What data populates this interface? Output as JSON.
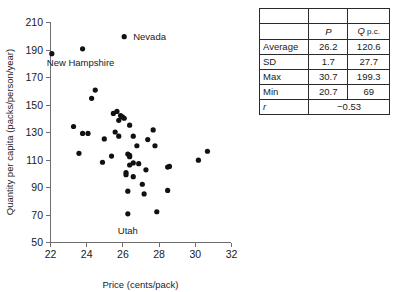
{
  "chart_data": {
    "type": "scatter",
    "title": "",
    "xlabel": "Price (cents/pack)",
    "ylabel": "Quantity per capita (packs/person/year)",
    "xlim": [
      22,
      32
    ],
    "ylim": [
      50,
      210
    ],
    "xticks": [
      22,
      24,
      26,
      28,
      30,
      32
    ],
    "yticks": [
      50,
      70,
      90,
      110,
      130,
      150,
      170,
      190,
      210
    ],
    "grid": false,
    "legend": "none",
    "annotations": [
      {
        "text": "Nevada",
        "x": 26.1,
        "y": 199.3
      },
      {
        "text": "New Hampshire",
        "x": 23.8,
        "y": 190.5
      },
      {
        "text": "Utah",
        "x": 26.3,
        "y": 70.5
      }
    ],
    "points": [
      {
        "x": 22.1,
        "y": 187.0
      },
      {
        "x": 23.8,
        "y": 190.5
      },
      {
        "x": 26.1,
        "y": 199.3
      },
      {
        "x": 24.5,
        "y": 160.5
      },
      {
        "x": 24.3,
        "y": 154.5
      },
      {
        "x": 25.5,
        "y": 143.5
      },
      {
        "x": 25.7,
        "y": 145.0
      },
      {
        "x": 25.9,
        "y": 142.0
      },
      {
        "x": 26.0,
        "y": 141.0
      },
      {
        "x": 26.1,
        "y": 140.0
      },
      {
        "x": 25.8,
        "y": 138.5
      },
      {
        "x": 23.3,
        "y": 134.0
      },
      {
        "x": 26.4,
        "y": 135.0
      },
      {
        "x": 27.7,
        "y": 131.5
      },
      {
        "x": 23.8,
        "y": 129.0
      },
      {
        "x": 24.1,
        "y": 129.0
      },
      {
        "x": 25.6,
        "y": 130.0
      },
      {
        "x": 25.8,
        "y": 127.0
      },
      {
        "x": 26.6,
        "y": 127.0
      },
      {
        "x": 25.0,
        "y": 125.0
      },
      {
        "x": 27.4,
        "y": 124.5
      },
      {
        "x": 26.8,
        "y": 120.0
      },
      {
        "x": 27.8,
        "y": 120.0
      },
      {
        "x": 30.7,
        "y": 116.0
      },
      {
        "x": 23.6,
        "y": 114.5
      },
      {
        "x": 26.3,
        "y": 114.0
      },
      {
        "x": 26.4,
        "y": 113.0
      },
      {
        "x": 26.4,
        "y": 112.0
      },
      {
        "x": 25.4,
        "y": 112.5
      },
      {
        "x": 24.9,
        "y": 108.0
      },
      {
        "x": 26.6,
        "y": 107.5
      },
      {
        "x": 26.9,
        "y": 107.0
      },
      {
        "x": 26.4,
        "y": 106.0
      },
      {
        "x": 30.2,
        "y": 109.5
      },
      {
        "x": 28.5,
        "y": 104.5
      },
      {
        "x": 28.6,
        "y": 105.0
      },
      {
        "x": 27.3,
        "y": 102.5
      },
      {
        "x": 26.2,
        "y": 100.5
      },
      {
        "x": 26.2,
        "y": 99.0
      },
      {
        "x": 26.6,
        "y": 97.5
      },
      {
        "x": 27.1,
        "y": 92.0
      },
      {
        "x": 26.3,
        "y": 87.0
      },
      {
        "x": 28.5,
        "y": 87.5
      },
      {
        "x": 27.2,
        "y": 85.0
      },
      {
        "x": 27.9,
        "y": 72.0
      },
      {
        "x": 26.3,
        "y": 70.5
      },
      {
        "x": 20.7,
        "y": 69.0
      }
    ]
  },
  "summary_table": {
    "columns": [
      "",
      "P",
      "Q p.c."
    ],
    "header": {
      "col1_symbol": "P",
      "col2_symbol": "Q",
      "col2_suffix": " p.c."
    },
    "rows": [
      {
        "label": "Average",
        "p": "26.2",
        "q": "120.6"
      },
      {
        "label": "SD",
        "p": "1.7",
        "q": "27.7"
      },
      {
        "label": "Max",
        "p": "30.7",
        "q": "199.3"
      },
      {
        "label": "Min",
        "p": "20.7",
        "q": "69"
      }
    ],
    "correlation": {
      "label": "r",
      "value": "−0.53"
    }
  }
}
